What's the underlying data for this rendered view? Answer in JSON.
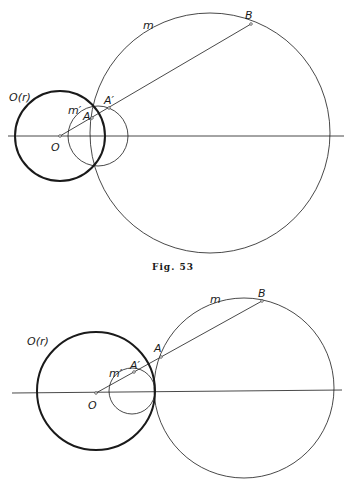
{
  "figures": [
    {
      "caption": "Fig. 53",
      "labels": {
        "circle_O": "O(r)",
        "center": "O",
        "circle_m": "m",
        "circle_m_prime": "m′",
        "point_A": "A",
        "point_A_prime": "A′",
        "point_B": "B"
      }
    },
    {
      "labels": {
        "circle_O": "O(r)",
        "center": "O",
        "circle_m": "m",
        "circle_m_prime": "m′",
        "point_A": "A",
        "point_A_prime": "A′",
        "point_B": "B"
      }
    }
  ],
  "colors": {
    "ink": "#1a1a1a",
    "paper": "#ffffff"
  }
}
